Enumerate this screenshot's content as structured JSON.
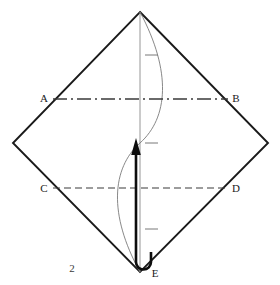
{
  "figure": {
    "number_label": "2",
    "stroke_color": "#1a1a1a",
    "thin_stroke_color": "#666666",
    "background": "#ffffff"
  },
  "vertices": {
    "top": {
      "x": 140,
      "y": 12
    },
    "right": {
      "x": 268,
      "y": 143
    },
    "bottom": {
      "x": 140,
      "y": 272
    },
    "left": {
      "x": 13,
      "y": 143
    }
  },
  "labels": [
    {
      "id": "A",
      "text": "A",
      "x": 44,
      "y": 102,
      "anchor": "middle"
    },
    {
      "id": "B",
      "text": "B",
      "x": 236,
      "y": 102,
      "anchor": "middle"
    },
    {
      "id": "C",
      "text": "C",
      "x": 44,
      "y": 192,
      "anchor": "middle"
    },
    {
      "id": "D",
      "text": "D",
      "x": 236,
      "y": 192,
      "anchor": "middle"
    },
    {
      "id": "E",
      "text": "E",
      "x": 155,
      "y": 277,
      "anchor": "middle"
    },
    {
      "id": "panel",
      "text": "2",
      "x": 72,
      "y": 272,
      "anchor": "middle"
    }
  ],
  "lines": {
    "ab": {
      "label_start": "A",
      "label_end": "B",
      "style": "dash-dot",
      "y": 99,
      "x1": 53,
      "x2": 228
    },
    "cd": {
      "label_start": "C",
      "label_end": "D",
      "style": "dashed",
      "y": 188,
      "x1": 53,
      "x2": 228
    },
    "center_axis": {
      "style": "solid-thin",
      "x": 140,
      "y1": 12,
      "y2": 272
    }
  },
  "curve": {
    "style": "thin-sinuous",
    "description": "S-shaped valley-fold curve from top vertex to bottom vertex",
    "path": "M140,12 C 172,72 168,118 140,143 C 112,168 108,214 140,272"
  },
  "tick_marks": [
    {
      "index": 1,
      "x": 152,
      "y": 55,
      "length": 13
    },
    {
      "index": 2,
      "x": 152,
      "y": 143,
      "length": 13
    },
    {
      "index": 3,
      "x": 152,
      "y": 229,
      "length": 13
    }
  ],
  "arrow": {
    "type": "fold-over-arrow",
    "direction": "up",
    "tail_hook": "u-turn loop at bottom vertex E",
    "shaft_x": 136,
    "tip_y": 140,
    "tail_y": 268
  }
}
